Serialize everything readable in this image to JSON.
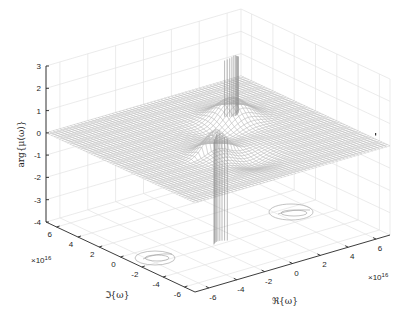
{
  "chart_data": {
    "type": "surface3d",
    "title": "",
    "xlabel": "ℜ{ω}",
    "ylabel": "ℑ{ω}",
    "zlabel": "arg{μ(ω)}",
    "x_exponent": "×10^16",
    "y_exponent": "×10^16",
    "x_ticks": [
      "-6",
      "-4",
      "-2",
      "0",
      "2",
      "4",
      "6"
    ],
    "y_ticks": [
      "6",
      "4",
      "2",
      "0",
      "-2",
      "-4",
      "-6"
    ],
    "z_ticks": [
      "3",
      "2",
      "1",
      "0",
      "-1",
      "-2",
      "-3",
      "-4"
    ],
    "xlim": [
      -7e+16,
      7e+16
    ],
    "ylim": [
      -7e+16,
      7e+16
    ],
    "zlim": [
      -4,
      3
    ],
    "grid": true,
    "baseline_z": 0,
    "features": [
      {
        "name": "left-pole",
        "re": -1.5e+16,
        "im": -2e+16,
        "peak_z": 1.2,
        "trough_z": -4.0
      },
      {
        "name": "right-pole",
        "re": 2.5e+16,
        "im": 2e+16,
        "peak_z": 3.0,
        "trough_z": -1.5
      }
    ],
    "floor_contours": [
      {
        "near": "left-pole",
        "re": -1.5e+16,
        "im": -2e+16
      },
      {
        "near": "right-pole",
        "re": 2.5e+16,
        "im": 2e+16
      }
    ]
  },
  "axes": {
    "z_label": "arg{μ(ω)}",
    "x_label": "ℜ{ω}",
    "y_label": "ℑ{ω}",
    "x_exp_base": "×10",
    "x_exp_pow": "16",
    "y_exp_base": "×10",
    "y_exp_pow": "16",
    "z_ticks": [
      "3",
      "2",
      "1",
      "0",
      "-1",
      "-2",
      "-3",
      "-4"
    ],
    "y_ticks": [
      "6",
      "4",
      "2",
      "0",
      "-2",
      "-4",
      "-6"
    ],
    "x_ticks": [
      "-6",
      "-4",
      "-2",
      "0",
      "2",
      "4",
      "6"
    ]
  }
}
